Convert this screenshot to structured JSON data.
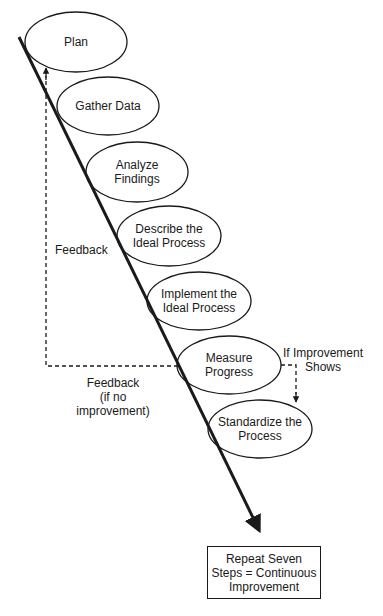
{
  "diagram": {
    "type": "process-flow",
    "steps": [
      {
        "label": "Plan",
        "cx": 76,
        "cy": 42
      },
      {
        "label": "Gather Data",
        "cx": 108,
        "cy": 106
      },
      {
        "label": "Analyze\nFindings",
        "cx": 137,
        "cy": 172
      },
      {
        "label": "Describe the\nIdeal Process",
        "cx": 169,
        "cy": 236
      },
      {
        "label": "Implement the\nIdeal Process",
        "cx": 199,
        "cy": 301
      },
      {
        "label": "Measure\nProgress",
        "cx": 229,
        "cy": 365
      },
      {
        "label": "Standardize the\nProcess",
        "cx": 260,
        "cy": 429
      }
    ],
    "feedback_label": "Feedback",
    "feedback_no_improvement_label": "Feedback\n(if no improvement)",
    "improvement_label": "If Improvement\nShows",
    "result_box_label": "Repeat Seven\nSteps = Continuous\nImprovement",
    "colors": {
      "stroke": "#1a1a1a",
      "background": "#ffffff"
    }
  }
}
